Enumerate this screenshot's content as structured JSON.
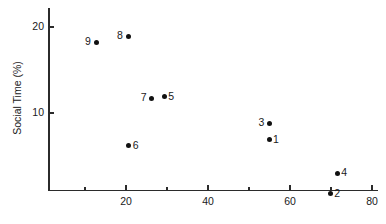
{
  "chart_data": {
    "type": "scatter",
    "title": "",
    "xlabel": "",
    "ylabel": "Social Time (%)",
    "xlim": [
      0,
      80
    ],
    "ylim": [
      0,
      22
    ],
    "grid": false,
    "legend": "none",
    "x_ticks": [
      {
        "value": 10,
        "label": "",
        "major": false
      },
      {
        "value": 20,
        "label": "20",
        "major": true
      },
      {
        "value": 30,
        "label": "",
        "major": false
      },
      {
        "value": 40,
        "label": "40",
        "major": true
      },
      {
        "value": 50,
        "label": "",
        "major": false
      },
      {
        "value": 60,
        "label": "60",
        "major": true
      },
      {
        "value": 70,
        "label": "",
        "major": false
      },
      {
        "value": 80,
        "label": "80",
        "major": true
      }
    ],
    "y_ticks": [
      {
        "value": 10,
        "label": "10"
      },
      {
        "value": 20,
        "label": "20"
      }
    ],
    "points": [
      {
        "label": "1",
        "x": 54.9,
        "y": 6.9,
        "label_side": "right"
      },
      {
        "label": "2",
        "x": 69.8,
        "y": 0.6,
        "label_side": "right"
      },
      {
        "label": "3",
        "x": 55.0,
        "y": 8.8,
        "label_side": "left"
      },
      {
        "label": "4",
        "x": 71.5,
        "y": 3.0,
        "label_side": "right"
      },
      {
        "label": "5",
        "x": 29.3,
        "y": 11.9,
        "label_side": "right"
      },
      {
        "label": "6",
        "x": 20.7,
        "y": 6.2,
        "label_side": "right"
      },
      {
        "label": "7",
        "x": 26.3,
        "y": 11.7,
        "label_side": "left"
      },
      {
        "label": "8",
        "x": 20.5,
        "y": 18.9,
        "label_side": "left"
      },
      {
        "label": "9",
        "x": 12.7,
        "y": 18.2,
        "label_side": "left"
      }
    ]
  }
}
